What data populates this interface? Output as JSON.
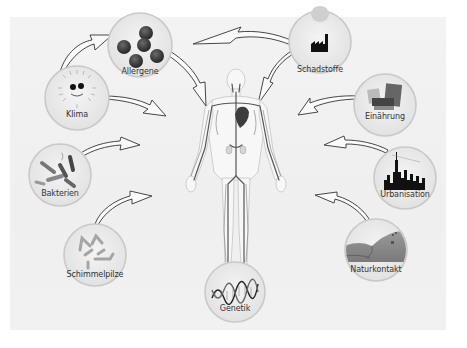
{
  "diagram": {
    "title": "",
    "center": {
      "name": "human-circulatory-system",
      "x": 236,
      "y": 170
    },
    "factors": [
      {
        "id": "allergene",
        "label": "Allergene",
        "cx": 140,
        "cy": 45,
        "r": 32,
        "side": "left"
      },
      {
        "id": "klima",
        "label": "Klima",
        "cx": 77,
        "cy": 98,
        "r": 32,
        "side": "left"
      },
      {
        "id": "bakterien",
        "label": "Bakterien",
        "cx": 60,
        "cy": 175,
        "r": 31,
        "side": "left"
      },
      {
        "id": "schimmelpilze",
        "label": "Schimmelpilze",
        "cx": 95,
        "cy": 255,
        "r": 31,
        "side": "left"
      },
      {
        "id": "genetik",
        "label": "Genetik",
        "cx": 235,
        "cy": 292,
        "r": 30,
        "side": "bottom"
      },
      {
        "id": "schadstoffe",
        "label": "Schadstoffe",
        "cx": 320,
        "cy": 42,
        "r": 31,
        "side": "right"
      },
      {
        "id": "einaehrung",
        "label": "Einährung",
        "cx": 385,
        "cy": 105,
        "r": 31,
        "side": "right"
      },
      {
        "id": "urbanisation",
        "label": "Urbanisation",
        "cx": 405,
        "cy": 178,
        "r": 31,
        "side": "right"
      },
      {
        "id": "naturkontakt",
        "label": "Naturkontakt",
        "cx": 376,
        "cy": 250,
        "r": 31,
        "side": "right"
      }
    ],
    "colors": {
      "background": "#ffffff",
      "panel": "#f0f0f0",
      "circle_fill": "#e9e9e9",
      "circle_border": "#c9c9c9",
      "arrow_stroke": "#333333",
      "vessel": "#555555",
      "body_outline": "#bdbdbd",
      "text": "#333333"
    }
  }
}
